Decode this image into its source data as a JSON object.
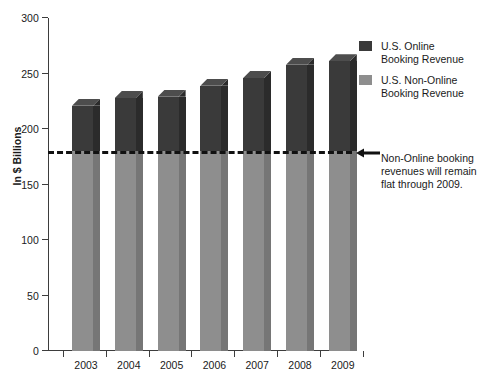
{
  "chart_data": {
    "type": "bar",
    "title": "",
    "subtitle": "",
    "xlabel": "",
    "ylabel": "In $ Billions",
    "categories": [
      "2003",
      "2004",
      "2005",
      "2006",
      "2007",
      "2008",
      "2009"
    ],
    "ylim": [
      0,
      300
    ],
    "yticks": [
      0,
      50,
      100,
      150,
      200,
      250,
      300
    ],
    "ytick_labels": [
      "0",
      "50",
      "100",
      "150",
      "200",
      "250",
      "300"
    ],
    "grid": false,
    "stacked": true,
    "three_d": true,
    "legend_position": "right-top",
    "series": [
      {
        "name": "U.S. Non-Online Booking Revenue",
        "color": "#8e8e8e",
        "values": [
          180,
          180,
          180,
          180,
          180,
          180,
          180
        ]
      },
      {
        "name": "U.S. Online Booking Revenue",
        "color": "#3a3a3a",
        "values": [
          41,
          48,
          49,
          59,
          66,
          78,
          81
        ]
      }
    ],
    "totals": [
      221,
      228,
      229,
      239,
      246,
      258,
      261
    ],
    "reference_line": {
      "value": 180,
      "style": "dashed",
      "color": "#111111",
      "label": "Non-Online booking revenues will remain flat through 2009."
    },
    "annotations": [
      {
        "text": "Non-Online booking revenues will remain flat through 2009.",
        "points_to": "reference-line",
        "arrow": "left"
      }
    ]
  },
  "axis": {
    "y_title": "In $ Billions",
    "y_ticks": [
      "300",
      "250",
      "200",
      "150",
      "100",
      "50",
      "0"
    ],
    "x_ticks": [
      "2003",
      "2004",
      "2005",
      "2006",
      "2007",
      "2008",
      "2009"
    ]
  },
  "legend": {
    "items": [
      {
        "color": "#3a3a3a",
        "line1": "U.S. Online",
        "line2": "Booking Revenue"
      },
      {
        "color": "#8e8e8e",
        "line1": "U.S. Non-Online",
        "line2": "Booking Revenue"
      }
    ]
  },
  "annotation": {
    "line1": "Non-Online booking",
    "line2": "revenues will remain",
    "line3": "flat through 2009."
  },
  "colors": {
    "online": "#3a3a3a",
    "online_side": "#2b2b2b",
    "online_top": "#4d4d4d",
    "non_online": "#8e8e8e",
    "non_online_side": "#767676",
    "axis": "#3d3d3d",
    "text": "#1a1a1a",
    "reference": "#111111",
    "background": "#ffffff"
  }
}
